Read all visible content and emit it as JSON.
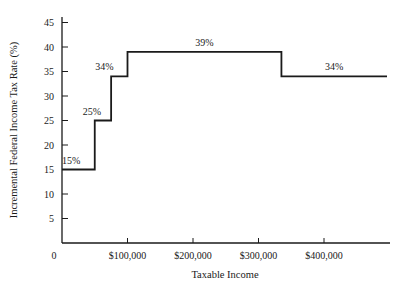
{
  "chart_data": {
    "type": "line",
    "subtype": "step",
    "title": "",
    "xlabel": "Taxable Income",
    "ylabel": "Incremental Federal Income Tax Rate (%)",
    "xlim": [
      0,
      500000
    ],
    "ylim": [
      0,
      45
    ],
    "x_ticks": [
      {
        "value": 0,
        "label": "0"
      },
      {
        "value": 100000,
        "label": "$100,000"
      },
      {
        "value": 200000,
        "label": "$200,000"
      },
      {
        "value": 300000,
        "label": "$300,000"
      },
      {
        "value": 400000,
        "label": "$400,000"
      }
    ],
    "y_ticks": [
      {
        "value": 5,
        "label": "5"
      },
      {
        "value": 10,
        "label": "10"
      },
      {
        "value": 15,
        "label": "15"
      },
      {
        "value": 20,
        "label": "20"
      },
      {
        "value": 25,
        "label": "25"
      },
      {
        "value": 30,
        "label": "30"
      },
      {
        "value": 35,
        "label": "35"
      },
      {
        "value": 40,
        "label": "40"
      },
      {
        "value": 45,
        "label": "45"
      }
    ],
    "grid": false,
    "legend": null,
    "series": [
      {
        "name": "Incremental tax rate",
        "segments": [
          {
            "x_start": 0,
            "x_end": 50000,
            "rate": 15,
            "label": "15%"
          },
          {
            "x_start": 50000,
            "x_end": 75000,
            "rate": 25,
            "label": "25%"
          },
          {
            "x_start": 75000,
            "x_end": 100000,
            "rate": 34,
            "label": "34%"
          },
          {
            "x_start": 100000,
            "x_end": 335000,
            "rate": 39,
            "label": "39%"
          },
          {
            "x_start": 335000,
            "x_end": 500000,
            "rate": 34,
            "label": "34%"
          }
        ]
      }
    ]
  }
}
